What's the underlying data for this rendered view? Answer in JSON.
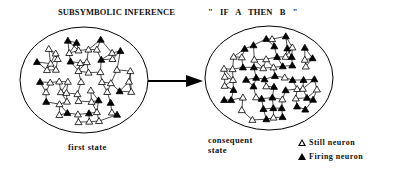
{
  "title": {
    "left": "SUBSYMBOLIC INFERENCE",
    "right": "\" IF  A   THEN    B \""
  },
  "captions": {
    "first_state": "first state",
    "consequent_state": "consequent state"
  },
  "legend": {
    "still": {
      "icon": "hollow-triangle-icon",
      "label": "Still neuron"
    },
    "firing": {
      "icon": "filled-triangle-icon",
      "label": "Firing neuron"
    }
  },
  "colors": {
    "ink": "#000000",
    "background": "#ffffff"
  }
}
